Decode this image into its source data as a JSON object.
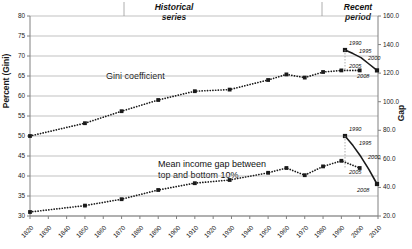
{
  "titles": {
    "historical": "Historical\nseries",
    "historical_line1": "Historical",
    "historical_line2": "series",
    "recent_line1": "Recent",
    "recent_line2": "period"
  },
  "axes": {
    "y_left_title": "Percent (Gini)",
    "y_right_title": "Gap",
    "y_left_ticks": [
      "30",
      "35",
      "40",
      "45",
      "50",
      "55",
      "60",
      "65",
      "70",
      "75",
      "80"
    ],
    "y_right_ticks": [
      "20.0",
      "40.0",
      "60.0",
      "80.0",
      "100.0",
      "120.0",
      "140.0",
      "160.0"
    ],
    "x_ticks": [
      "1820",
      "1830",
      "1840",
      "1850",
      "1860",
      "1870",
      "1880",
      "1890",
      "1900",
      "1910",
      "1920",
      "1930",
      "1940",
      "1950",
      "1960",
      "1970",
      "1980",
      "1990",
      "2000",
      "2010"
    ]
  },
  "series_labels": {
    "gini": "Gini coefficient",
    "gap_line1": "Mean income gap between",
    "gap_line2": "top and bottom 10%"
  },
  "annotations": {
    "gini_recent": [
      "1990",
      "1995",
      "2000",
      "2005",
      "2008"
    ],
    "gap_recent": [
      "1990",
      "1995",
      "2000",
      "2005",
      "2008"
    ]
  },
  "colors": {
    "series": "#1a1a1a",
    "grid": "#a6a6a6",
    "axis": "#808080",
    "background": "#ffffff"
  },
  "chart_data": {
    "type": "line",
    "xlabel": "",
    "ylabel": "Percent (Gini)",
    "ylabel_secondary": "Gap",
    "xlim": [
      1820,
      2010
    ],
    "ylim": [
      30,
      80
    ],
    "ylim_secondary": [
      20.0,
      160.0
    ],
    "grid": true,
    "legend": "inline-annotation",
    "series": [
      {
        "name": "Gini coefficient",
        "axis": "left",
        "style": "dotted-with-square-markers",
        "x": [
          1820,
          1850,
          1870,
          1890,
          1910,
          1929,
          1950,
          1960,
          1970,
          1980,
          1990,
          2000
        ],
        "values": [
          50.0,
          53.2,
          56.2,
          59.0,
          61.2,
          61.6,
          64.0,
          65.4,
          64.6,
          66.0,
          66.4,
          66.4
        ]
      },
      {
        "name": "Gini coefficient (recent period)",
        "axis": "left",
        "style": "solid-with-square-markers",
        "x": [
          1990,
          1995,
          2000,
          2005,
          2008
        ],
        "values": [
          71.5,
          70.6,
          69.6,
          68.0,
          66.4
        ],
        "point_labels": [
          "1990",
          "1995",
          "2000",
          "2005",
          "2008"
        ]
      },
      {
        "name": "Mean income gap between top and bottom 10%",
        "axis": "right",
        "style": "dotted-with-square-markers",
        "x": [
          1820,
          1850,
          1870,
          1890,
          1910,
          1929,
          1950,
          1960,
          1970,
          1980,
          1990,
          2000
        ],
        "values": [
          31.0,
          36.0,
          40.4,
          45.2,
          50.4,
          52.4,
          58.2,
          61.6,
          57.0,
          62.2,
          66.6,
          61.4
        ],
        "values_left_scale": [
          31.0,
          32.6,
          34.2,
          36.5,
          38.2,
          39.0,
          40.8,
          42.0,
          40.2,
          42.4,
          43.8,
          42.0
        ]
      },
      {
        "name": "Mean income gap (recent period)",
        "axis": "right",
        "style": "solid-with-square-markers",
        "x": [
          1990,
          1995,
          2000,
          2005,
          2008
        ],
        "values": [
          100.0,
          93.0,
          85.0,
          76.0,
          66.0
        ],
        "values_left_scale": [
          50.0,
          47.6,
          44.8,
          41.6,
          38.0
        ],
        "point_labels": [
          "1990",
          "1995",
          "2000",
          "2005",
          "2008"
        ]
      }
    ]
  }
}
